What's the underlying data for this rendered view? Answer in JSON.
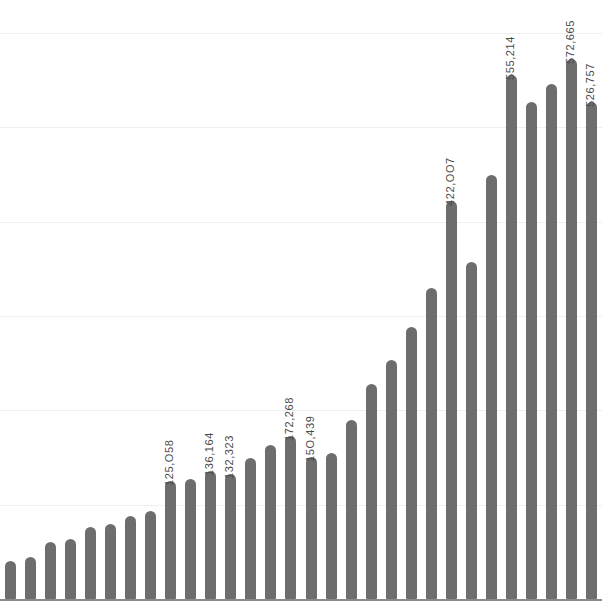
{
  "chart_data": {
    "type": "bar",
    "title": "",
    "subtitle": "",
    "xlabel": "",
    "ylabel": "",
    "grid": true,
    "legend": false,
    "orientation": "vertical",
    "bar_color": "#6d6d6d",
    "gridline_color": "#efefef",
    "axis_color": "#8a8a8a",
    "background_color": "#ffffff",
    "label_color": "#4a4a4a",
    "label_rotation_deg": -90,
    "ylim": [
      0,
      620000
    ],
    "gridline_values": [
      0,
      100000,
      200000,
      300000,
      400000,
      500000,
      600000
    ],
    "categories": [
      "1",
      "2",
      "3",
      "4",
      "5",
      "6",
      "7",
      "8",
      "9",
      "10",
      "11",
      "12",
      "13",
      "14",
      "15",
      "16",
      "17",
      "18",
      "19",
      "20",
      "21",
      "22",
      "23",
      "24",
      "25",
      "26",
      "27",
      "28",
      "29",
      "30"
    ],
    "values": [
      40000,
      45000,
      60000,
      64000,
      76000,
      80000,
      88000,
      93000,
      125058,
      127000,
      136164,
      132323,
      150000,
      163000,
      172268,
      150439,
      155000,
      190000,
      228000,
      253000,
      288000,
      330000,
      422007,
      357000,
      450000,
      555214,
      527000,
      546000,
      572665,
      526757
    ],
    "data_labels": [
      {
        "index": 8,
        "text": "125,O58"
      },
      {
        "index": 10,
        "text": "136,164"
      },
      {
        "index": 11,
        "text": "132,323"
      },
      {
        "index": 14,
        "text": "172,268"
      },
      {
        "index": 15,
        "text": "15O,439"
      },
      {
        "index": 22,
        "text": "422,OO7"
      },
      {
        "index": 25,
        "text": "555,214"
      },
      {
        "index": 28,
        "text": "572,665"
      },
      {
        "index": 29,
        "text": "526,757"
      }
    ]
  }
}
